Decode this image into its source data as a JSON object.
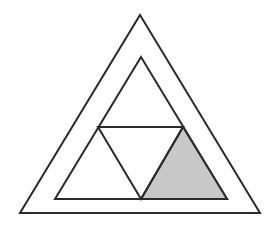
{
  "figure": {
    "canvas": {
      "width": 279,
      "height": 225,
      "background_color": "#ffffff"
    },
    "style": {
      "stroke_color": "#2b2b2b",
      "stroke_width": 2,
      "shade_fill_color": "#c8c8c8",
      "unfilled_color": "#ffffff"
    },
    "shapes": [
      {
        "name": "outer-triangle",
        "kind": "triangle",
        "filled": false,
        "fill_color": "#ffffff",
        "stroke_color": "#2b2b2b",
        "points": "140,15 260,213 20,213",
        "vertices": [
          {
            "label": "apex",
            "x": 140,
            "y": 15
          },
          {
            "label": "bottom-right",
            "x": 260,
            "y": 213
          },
          {
            "label": "bottom-left",
            "x": 20,
            "y": 213
          }
        ]
      },
      {
        "name": "middle-triangle",
        "kind": "triangle",
        "filled": false,
        "fill_color": "#ffffff",
        "stroke_color": "#2b2b2b",
        "points": "141,57 227,199 55,199",
        "vertices": [
          {
            "label": "apex",
            "x": 141,
            "y": 57
          },
          {
            "label": "bottom-right",
            "x": 227,
            "y": 199
          },
          {
            "label": "bottom-left",
            "x": 55,
            "y": 199
          }
        ]
      },
      {
        "name": "shaded-corner-triangle",
        "kind": "triangle",
        "filled": true,
        "fill_color": "#c8c8c8",
        "stroke_color": "#2b2b2b",
        "points": "183,127 227,199 141,199",
        "vertices": [
          {
            "label": "top",
            "x": 183,
            "y": 127
          },
          {
            "label": "bottom-right",
            "x": 227,
            "y": 199
          },
          {
            "label": "bottom-left",
            "x": 141,
            "y": 199
          }
        ]
      },
      {
        "name": "inverted-inner-triangle",
        "kind": "triangle",
        "filled": false,
        "fill_color": "#ffffff",
        "stroke_color": "#2b2b2b",
        "points": "98,127 183,127 141,199",
        "vertices": [
          {
            "label": "top-left",
            "x": 98,
            "y": 127
          },
          {
            "label": "top-right",
            "x": 183,
            "y": 127
          },
          {
            "label": "bottom",
            "x": 141,
            "y": 199
          }
        ]
      }
    ],
    "segments": [
      {
        "name": "horizontal-midline",
        "x1": 98,
        "y1": 127,
        "x2": 183,
        "y2": 127,
        "stroke_color": "#2b2b2b"
      }
    ]
  }
}
